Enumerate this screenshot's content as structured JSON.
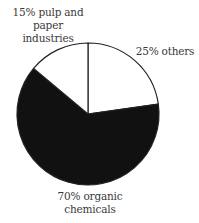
{
  "chart_data": {
    "type": "pie",
    "title": "",
    "slices": [
      {
        "label": "others",
        "value": 25,
        "color": "#ffffff",
        "start_deg": 0,
        "end_deg": 82
      },
      {
        "label": "organic chemicals",
        "value": 70,
        "color": "#111111",
        "start_deg": 82,
        "end_deg": 310
      },
      {
        "label": "pulp and paper industries",
        "value": 15,
        "color": "#ffffff",
        "start_deg": 310,
        "end_deg": 360
      }
    ],
    "categories": [
      "others",
      "organic chemicals",
      "pulp and paper industries"
    ],
    "values": [
      25,
      70,
      15
    ],
    "legend": "none (direct labels)"
  },
  "labels": {
    "pulp_line1": "15% pulp and",
    "pulp_line2": "paper",
    "pulp_line3": "industries",
    "others": "25% others",
    "organic_line1": "70% organic",
    "organic_line2": "chemicals"
  },
  "geometry": {
    "cx": 88,
    "cy": 114,
    "r": 71
  }
}
